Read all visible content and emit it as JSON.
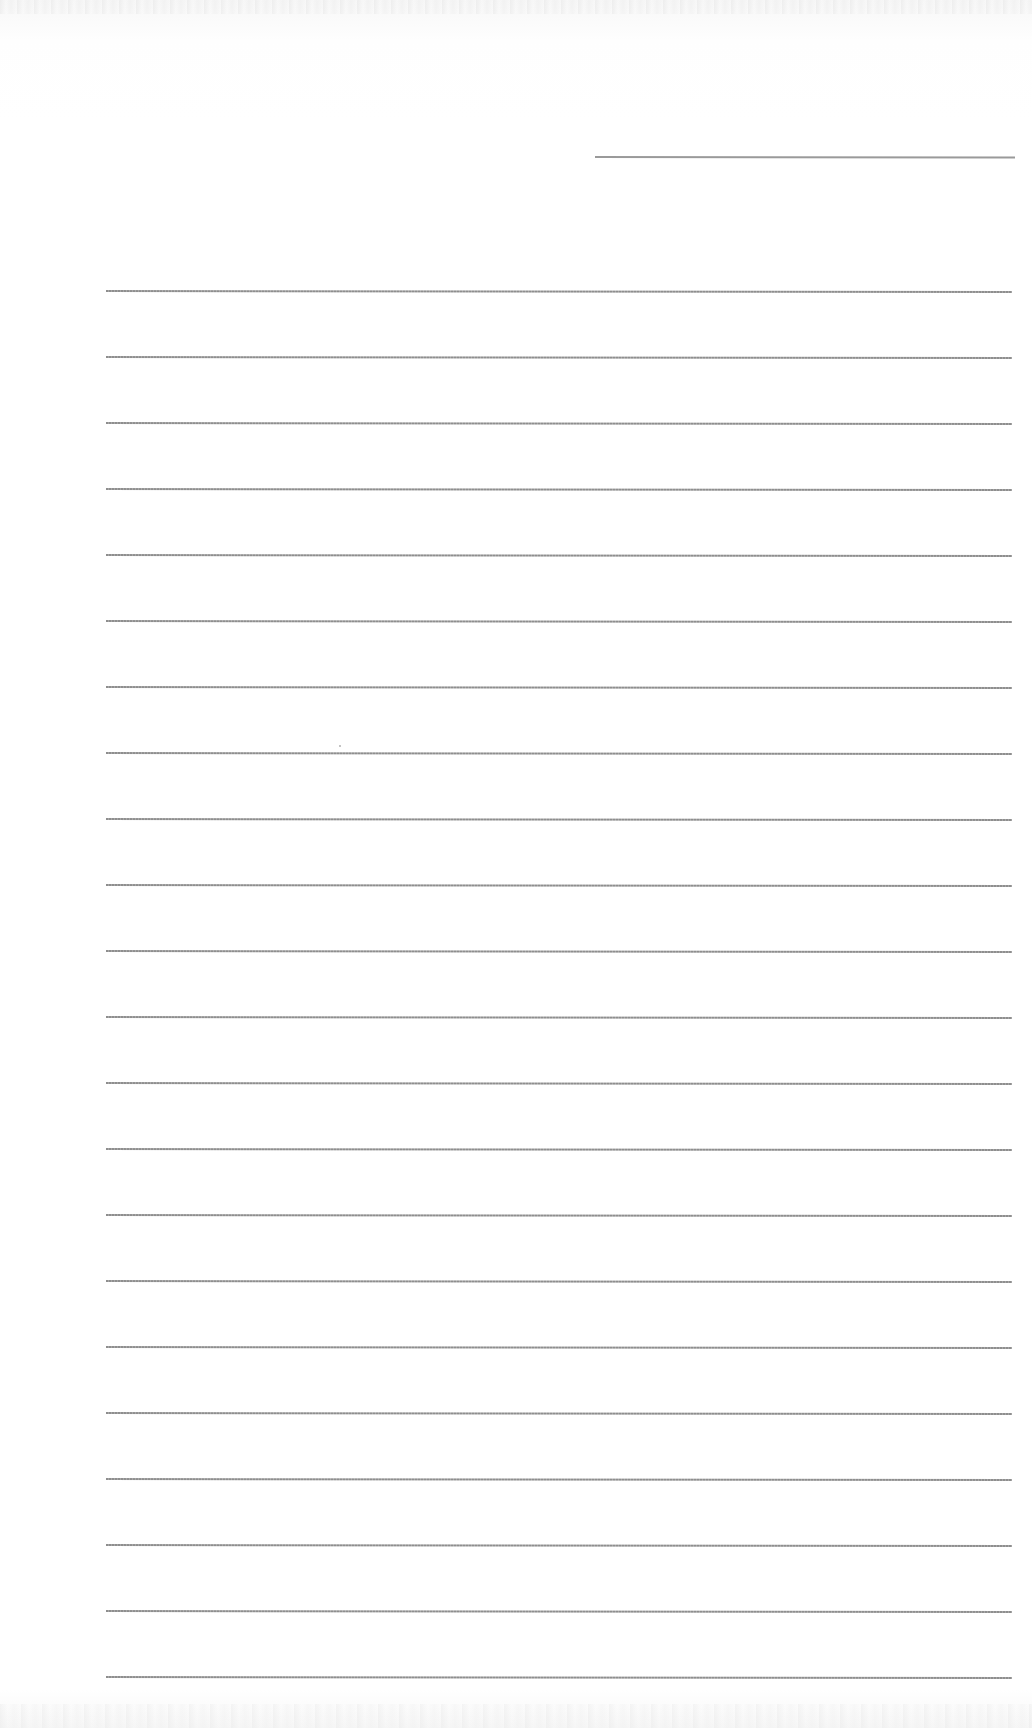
{
  "document": {
    "type": "lined-paper",
    "header_line": {
      "present": true,
      "position": "top-right"
    },
    "ruled_lines_count": 22,
    "line_color": "#8e8e8e",
    "paper_color": "#ffffff",
    "text_content": ""
  }
}
